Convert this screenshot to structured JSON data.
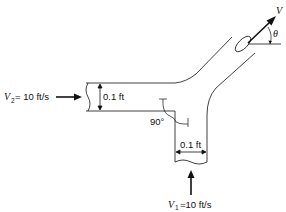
{
  "diagram": {
    "type": "pipe-y-junction",
    "inlet_2": {
      "label_symbol": "V",
      "label_subscript": "2",
      "label_value": "= 10 ft/s",
      "diameter_label": "0.1 ft"
    },
    "inlet_1": {
      "label_symbol": "V",
      "label_subscript": "1",
      "label_value": "=10 ft/s",
      "diameter_label": "0.1 ft"
    },
    "outlet": {
      "velocity_label": "V",
      "angle_label": "θ"
    },
    "angle_annotation": "90°",
    "colors": {
      "stroke": "#111111",
      "background": "#ffffff"
    }
  }
}
